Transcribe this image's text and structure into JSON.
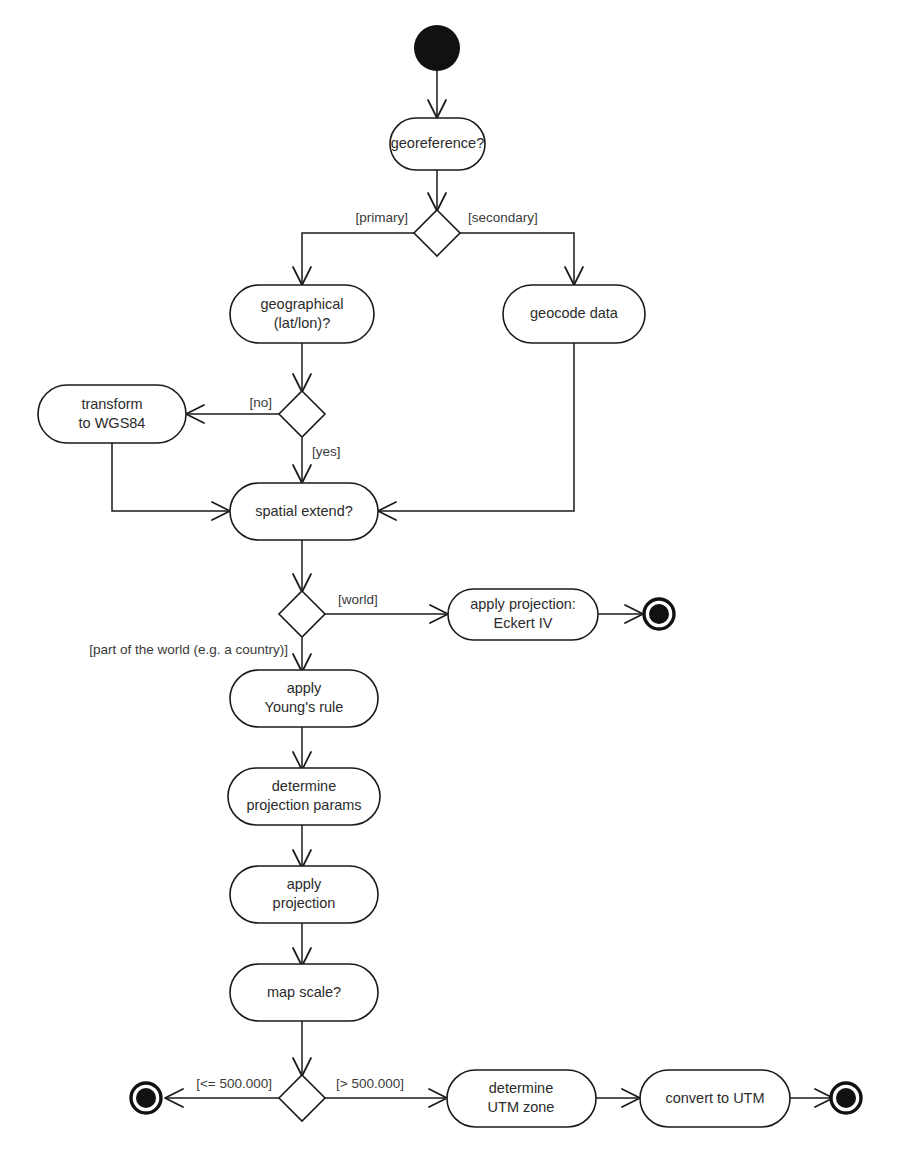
{
  "diagram": {
    "type": "uml-activity-diagram",
    "caption": "",
    "background_color": "#ffffff",
    "line_color": "#1a1a1a",
    "text_color": "#2b2b2b",
    "nodes": {
      "initial": {
        "kind": "initial",
        "label": ""
      },
      "georeference": {
        "kind": "activity",
        "label": "georeference?"
      },
      "decision_georeference": {
        "kind": "decision",
        "label": ""
      },
      "geographical": {
        "kind": "activity",
        "line1": "geographical",
        "line2": "(lat/lon)?"
      },
      "geocode_data": {
        "kind": "activity",
        "label": "geocode data"
      },
      "decision_geographical": {
        "kind": "decision",
        "label": ""
      },
      "transform_wgs84": {
        "kind": "activity",
        "line1": "transform",
        "line2": "to WGS84"
      },
      "spatial_extend": {
        "kind": "activity",
        "label": "spatial extend?"
      },
      "decision_extend": {
        "kind": "decision",
        "label": ""
      },
      "apply_projection_eckert": {
        "kind": "activity",
        "line1": "apply projection:",
        "line2": "Eckert IV"
      },
      "final_eckert": {
        "kind": "final",
        "label": ""
      },
      "apply_youngs_rule": {
        "kind": "activity",
        "line1": "apply",
        "line2": "Young's rule"
      },
      "determine_projection_params": {
        "kind": "activity",
        "line1": "determine",
        "line2": "projection params"
      },
      "apply_projection": {
        "kind": "activity",
        "line1": "apply",
        "line2": "projection"
      },
      "map_scale": {
        "kind": "activity",
        "label": "map scale?"
      },
      "decision_scale": {
        "kind": "decision",
        "label": ""
      },
      "final_small_scale": {
        "kind": "final",
        "label": ""
      },
      "determine_utm_zone": {
        "kind": "activity",
        "line1": "determine",
        "line2": "UTM zone"
      },
      "convert_to_utm": {
        "kind": "activity",
        "label": "convert to UTM"
      },
      "final_utm": {
        "kind": "final",
        "label": ""
      }
    },
    "guards": {
      "primary": "[primary]",
      "secondary": "[secondary]",
      "no": "[no]",
      "yes": "[yes]",
      "world": "[world]",
      "part_of_world": "[part of the world (e.g. a country)]",
      "scale_small": "[<= 500.000]",
      "scale_large": "[> 500.000]"
    },
    "edges": [
      {
        "from": "initial",
        "to": "georeference",
        "guard": ""
      },
      {
        "from": "georeference",
        "to": "decision_georeference",
        "guard": ""
      },
      {
        "from": "decision_georeference",
        "to": "geographical",
        "guard": "[primary]"
      },
      {
        "from": "decision_georeference",
        "to": "geocode_data",
        "guard": "[secondary]"
      },
      {
        "from": "geographical",
        "to": "decision_geographical",
        "guard": ""
      },
      {
        "from": "decision_geographical",
        "to": "transform_wgs84",
        "guard": "[no]"
      },
      {
        "from": "decision_geographical",
        "to": "spatial_extend",
        "guard": "[yes]"
      },
      {
        "from": "transform_wgs84",
        "to": "spatial_extend",
        "guard": ""
      },
      {
        "from": "geocode_data",
        "to": "spatial_extend",
        "guard": ""
      },
      {
        "from": "spatial_extend",
        "to": "decision_extend",
        "guard": ""
      },
      {
        "from": "decision_extend",
        "to": "apply_projection_eckert",
        "guard": "[world]"
      },
      {
        "from": "apply_projection_eckert",
        "to": "final_eckert",
        "guard": ""
      },
      {
        "from": "decision_extend",
        "to": "apply_youngs_rule",
        "guard": "[part of the world (e.g. a country)]"
      },
      {
        "from": "apply_youngs_rule",
        "to": "determine_projection_params",
        "guard": ""
      },
      {
        "from": "determine_projection_params",
        "to": "apply_projection",
        "guard": ""
      },
      {
        "from": "apply_projection",
        "to": "map_scale",
        "guard": ""
      },
      {
        "from": "map_scale",
        "to": "decision_scale",
        "guard": ""
      },
      {
        "from": "decision_scale",
        "to": "final_small_scale",
        "guard": "[<= 500.000]"
      },
      {
        "from": "decision_scale",
        "to": "determine_utm_zone",
        "guard": "[> 500.000]"
      },
      {
        "from": "determine_utm_zone",
        "to": "convert_to_utm",
        "guard": ""
      },
      {
        "from": "convert_to_utm",
        "to": "final_utm",
        "guard": ""
      }
    ]
  }
}
